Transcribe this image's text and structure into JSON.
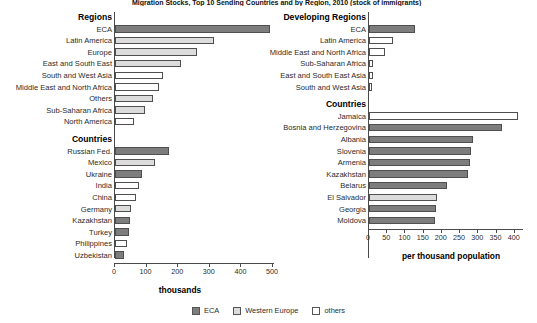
{
  "title": "Migration Stocks, Top 10 Sending Countries and by Region, 2010 (stock of immigrants)",
  "legend": {
    "items": [
      {
        "label": "ECA",
        "fill": "#7d7d7d",
        "key": "eca"
      },
      {
        "label": "Western Europe",
        "fill": "#dcdcdc",
        "key": "we"
      },
      {
        "label": "others",
        "fill": "#ffffff",
        "key": "other"
      }
    ]
  },
  "chart_data": [
    {
      "type": "bar",
      "id": "left",
      "title": "",
      "xlabel": "thousands",
      "ylabel": "",
      "orientation": "horizontal",
      "xlim": [
        0,
        500
      ],
      "xticks": [
        0,
        100,
        200,
        300,
        400,
        500
      ],
      "grid": false,
      "groups": [
        {
          "header": "Regions",
          "categories": [
            "ECA",
            "Latin America",
            "Europe",
            "East and South East",
            "South and West Asia",
            "Middle East and North Africa",
            "Others",
            "Sub-Saharan Africa",
            "North America"
          ],
          "values": [
            490,
            313,
            260,
            210,
            152,
            140,
            120,
            95,
            60
          ],
          "fills": [
            "eca",
            "we",
            "we",
            "we",
            "other",
            "other",
            "we",
            "we",
            "other"
          ]
        },
        {
          "header": "Countries",
          "categories": [
            "Russian Fed.",
            "Mexico",
            "Ukraine",
            "India",
            "China",
            "Germany",
            "Kazakhstan",
            "Turkey",
            "Philippines",
            "Uzbekistan"
          ],
          "values": [
            170,
            128,
            85,
            75,
            66,
            50,
            48,
            44,
            38,
            28
          ],
          "fills": [
            "eca",
            "we",
            "eca",
            "other",
            "other",
            "we",
            "eca",
            "eca",
            "other",
            "eca"
          ]
        }
      ]
    },
    {
      "type": "bar",
      "id": "right",
      "title": "",
      "xlabel": "per thousand population",
      "ylabel": "",
      "orientation": "horizontal",
      "xlim": [
        0,
        420
      ],
      "xticks": [
        0,
        50,
        100,
        150,
        200,
        250,
        300,
        350,
        400
      ],
      "grid": false,
      "groups": [
        {
          "header": "Developing Regions",
          "categories": [
            "ECA",
            "Latin America",
            "Middle East and North Africa",
            "Sub-Saharan Africa",
            "East and South East Asia",
            "South and West Asia"
          ],
          "values": [
            125,
            65,
            45,
            10,
            10,
            8
          ],
          "fills": [
            "eca",
            "other",
            "other",
            "other",
            "other",
            "other"
          ]
        },
        {
          "header": "Countries",
          "categories": [
            "Jamaica",
            "Bosnia and Herzegovina",
            "Albania",
            "Slovenia",
            "Armenia",
            "Kazakhstan",
            "Belarus",
            "El Salvador",
            "Georgia",
            "Moldova"
          ],
          "values": [
            410,
            365,
            285,
            280,
            277,
            272,
            215,
            188,
            185,
            180
          ],
          "fills": [
            "other",
            "eca",
            "eca",
            "eca",
            "eca",
            "eca",
            "eca",
            "we",
            "eca",
            "eca"
          ]
        }
      ]
    }
  ]
}
